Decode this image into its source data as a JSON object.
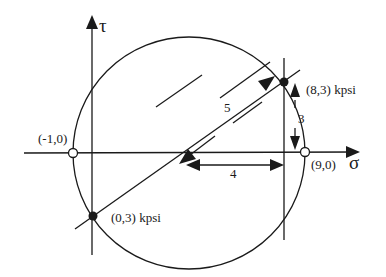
{
  "diagram": {
    "axes": {
      "horizontal_label": "σ",
      "vertical_label": "τ"
    },
    "points": [
      {
        "label": "(-1,0)",
        "kind": "open"
      },
      {
        "label": "(9,0)",
        "kind": "open"
      },
      {
        "label": "(8,3) kpsi",
        "kind": "filled"
      },
      {
        "label": "(0,3) kpsi",
        "kind": "filled"
      }
    ],
    "dimensions": {
      "radius": "5",
      "vertical": "3",
      "horizontal": "4"
    },
    "colors": {
      "line": "#1a1a1a",
      "background": "#ffffff"
    }
  }
}
